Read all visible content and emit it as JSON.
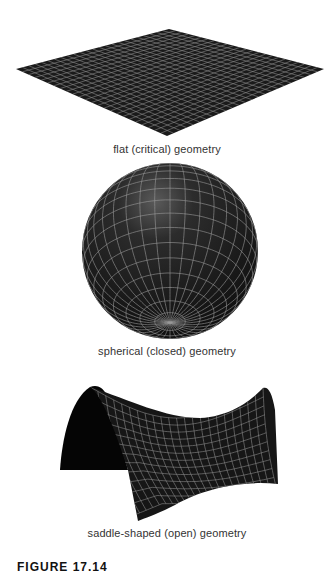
{
  "figure": {
    "label": "FIGURE 17.14",
    "panels": [
      {
        "id": "flat",
        "caption": "flat (critical) geometry",
        "surface_color": "#1a1a1a",
        "grid_color": "#8a8a8a"
      },
      {
        "id": "spherical",
        "caption": "spherical (closed) geometry",
        "surface_color": "#1e1e1e",
        "grid_color": "#9a9a9a"
      },
      {
        "id": "saddle",
        "caption": "saddle-shaped (open) geometry",
        "surface_color": "#141414",
        "grid_color": "#8c8c8c"
      }
    ]
  }
}
